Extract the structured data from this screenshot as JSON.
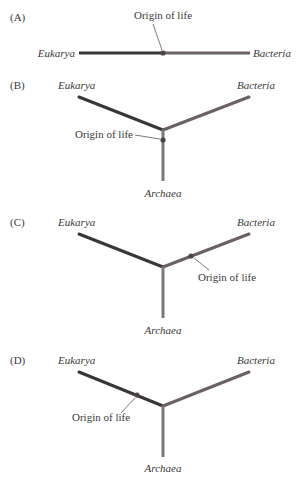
{
  "colors": {
    "eukarya": "#3a3636",
    "bacteria": "#6b6062",
    "archaea": "#7a7878",
    "text": "#3a3838",
    "background": "#ffffff"
  },
  "labels": {
    "eukarya": "Eukarya",
    "bacteria": "Bacteria",
    "archaea": "Archaea",
    "origin": "Origin of life"
  },
  "panels": [
    {
      "id": "A",
      "label": "(A)",
      "layout": "linear",
      "origin_on": "midpoint between Eukarya and Bacteria"
    },
    {
      "id": "B",
      "label": "(B)",
      "layout": "three-branch",
      "origin_on": "Archaea branch near root"
    },
    {
      "id": "C",
      "label": "(C)",
      "layout": "three-branch",
      "origin_on": "Bacteria branch"
    },
    {
      "id": "D",
      "label": "(D)",
      "layout": "three-branch",
      "origin_on": "Eukarya branch"
    }
  ]
}
